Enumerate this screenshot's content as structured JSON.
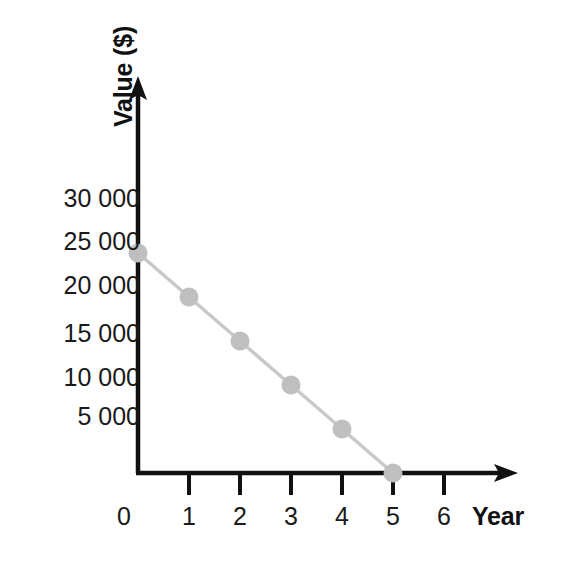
{
  "chart_data": {
    "type": "line",
    "title": "",
    "subtitle": "",
    "xlabel": "Year",
    "ylabel": "Value ($)",
    "x": [
      0,
      1,
      2,
      3,
      4,
      5
    ],
    "values": [
      25000,
      20000,
      15000,
      10000,
      5000,
      0
    ],
    "series": [
      {
        "name": "Value",
        "values": [
          25000,
          20000,
          15000,
          10000,
          5000,
          0
        ]
      }
    ],
    "xlim": [
      0,
      6.6
    ],
    "ylim": [
      0,
      33000
    ],
    "x_tick_labels": [
      "0",
      "1",
      "2",
      "3",
      "4",
      "5",
      "6"
    ],
    "x_tick_values": [
      0,
      1,
      2,
      3,
      4,
      5,
      6
    ],
    "y_tick_labels": [
      "30 000",
      "25 000",
      "20 000",
      "15 000",
      "10 000",
      "5 000"
    ],
    "y_tick_values": [
      30000,
      25000,
      20000,
      15000,
      10000,
      5000
    ],
    "grid": false,
    "legend": false,
    "legend_position": "none",
    "annotations": [],
    "colors": {
      "axis": "#111111",
      "line": "#c9c9c9",
      "marker": "#bfbfbf",
      "text": "#1a1a1a",
      "background": "#ffffff"
    },
    "marker_style": "circle",
    "axis_arrows": true
  },
  "axes": {
    "y_title": "Value ($)",
    "x_title": "Year"
  },
  "y_ticks": [
    {
      "label": "30 000",
      "value": 30000
    },
    {
      "label": "25 000",
      "value": 25000
    },
    {
      "label": "20 000",
      "value": 20000
    },
    {
      "label": "15 000",
      "value": 15000
    },
    {
      "label": "10 000",
      "value": 10000
    },
    {
      "label": "5 000",
      "value": 5000
    }
  ],
  "x_ticks": [
    {
      "label": "0",
      "value": 0
    },
    {
      "label": "1",
      "value": 1
    },
    {
      "label": "2",
      "value": 2
    },
    {
      "label": "3",
      "value": 3
    },
    {
      "label": "4",
      "value": 4
    },
    {
      "label": "5",
      "value": 5
    },
    {
      "label": "6",
      "value": 6
    }
  ]
}
